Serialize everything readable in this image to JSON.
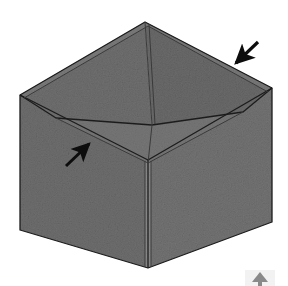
{
  "canvas": {
    "width": 288,
    "height": 286,
    "background": "#ffffff",
    "title": "Open cardboard box in isometric view with two annotation arrows"
  },
  "palette": {
    "background": "#ffffff",
    "outline": "#1c1c1c",
    "seam_line": "#3a3a3a",
    "arrow": "#0d0d0d",
    "face_top_left_rim": "#7a7a7a",
    "face_top_right_rim": "#787878",
    "face_inner_back_left": "#6f6f6f",
    "face_inner_back_right": "#6a6a6a",
    "face_inner_floor": "#767676",
    "face_front_left": "#6e6e6e",
    "face_front_right": "#737373",
    "face_flap_strip": "#8a8a8a",
    "noise_dark": "#5a5a5a",
    "noise_light": "#8d8d8d"
  },
  "object": {
    "name": "cardboard-box",
    "kind": "open-top box",
    "projection": "isometric",
    "description": "A grey textured open cardboard box seen from above at an isometric angle, showing two outer side walls, the top rim, and two inner walls plus the inner floor.",
    "vertices": {
      "rim_back": [
        145,
        22
      ],
      "rim_left": [
        20,
        95
      ],
      "rim_right": [
        272,
        88
      ],
      "rim_front": [
        148,
        160
      ],
      "inner_back": [
        152,
        125
      ],
      "inner_left": [
        56,
        118
      ],
      "inner_right": [
        243,
        112
      ],
      "inner_front": [
        148,
        163
      ],
      "base_left": [
        20,
        230
      ],
      "base_right": [
        272,
        222
      ],
      "base_front": [
        148,
        268
      ]
    },
    "faces": [
      {
        "name": "rim-left",
        "label": "Top rim — left side"
      },
      {
        "name": "rim-right",
        "label": "Top rim — right side"
      },
      {
        "name": "inner-wall-back-left",
        "label": "Inner wall — back left"
      },
      {
        "name": "inner-wall-back-right",
        "label": "Inner wall — back right"
      },
      {
        "name": "inner-floor",
        "label": "Inner floor"
      },
      {
        "name": "outer-wall-front-left",
        "label": "Outer wall — front left"
      },
      {
        "name": "outer-wall-front-right",
        "label": "Outer wall — front right"
      }
    ],
    "seams": [
      {
        "name": "back-inner-vertical-seam",
        "from": [
          145,
          22
        ],
        "to": [
          152,
          125
        ]
      },
      {
        "name": "front-corner-flap-seam",
        "from": [
          148,
          160
        ],
        "to": [
          148,
          268
        ]
      }
    ]
  },
  "annotations": {
    "arrows": [
      {
        "id": "arrow-top-right",
        "name": "arrow-pointing-to-top-rim-edge",
        "direction": "down-left",
        "angle_deg": 225,
        "tail": [
          258,
          42
        ],
        "tip": [
          233,
          66
        ],
        "points_at": "rim-right outer top edge",
        "color": "#0d0d0d"
      },
      {
        "id": "arrow-mid-left",
        "name": "arrow-pointing-to-inner-floor-edge",
        "direction": "up-right",
        "angle_deg": 45,
        "tail": [
          66,
          166
        ],
        "tip": [
          92,
          141
        ],
        "points_at": "inner floor left edge",
        "color": "#0d0d0d"
      }
    ],
    "corner_artifact": {
      "name": "cropped-arrow-artifact-bottom-right",
      "visible": true,
      "position": [
        252,
        262
      ],
      "description": "Partially cropped faint arrow glyph at the bottom right edge of the image"
    }
  },
  "labels": {
    "figure_caption": "",
    "alt_text": "Isometric grey open cardboard box with two black arrows indicating rim and inner floor edges."
  }
}
